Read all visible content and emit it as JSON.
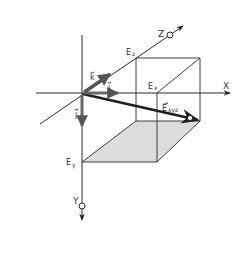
{
  "diagram": {
    "axes": {
      "x": {
        "label": "X"
      },
      "y": {
        "label": "Y"
      },
      "z": {
        "label": "Z"
      }
    },
    "unit_vectors": {
      "i": {
        "label": "i",
        "arrow": "→"
      },
      "j": {
        "label": "j",
        "arrow": "→"
      },
      "k": {
        "label": "k",
        "arrow": "→"
      }
    },
    "components": {
      "ex": {
        "label": "E",
        "sub": "x"
      },
      "ey": {
        "label": "E",
        "sub": "y"
      },
      "ez": {
        "label": "E",
        "sub": "z"
      }
    },
    "resultant": {
      "label": "E",
      "sub": "xyz",
      "arrow": "→"
    },
    "colors": {
      "line": "#2a2a2a",
      "shade": "#dcdcdc",
      "unit_vector": "#555555"
    }
  }
}
